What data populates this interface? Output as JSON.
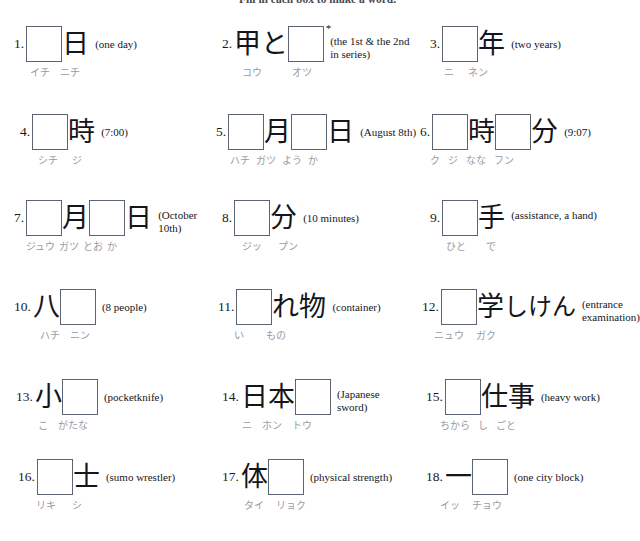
{
  "worksheet": {
    "instruction": "Fill in each box to make a word.",
    "exercise_count": 18
  },
  "items": [
    {
      "number": "1.",
      "gloss": "(one day)",
      "gloss_lines": 1,
      "asterisk": "",
      "glyphs": [
        {
          "type": "box",
          "text": ""
        },
        {
          "type": "kanji",
          "text": "日"
        }
      ],
      "readings": [
        "イチ",
        "ニチ"
      ]
    },
    {
      "number": "2.",
      "gloss": "(the 1st & the 2nd in series)",
      "gloss_lines": 2,
      "asterisk": "*",
      "glyphs": [
        {
          "type": "kanji",
          "text": "甲"
        },
        {
          "type": "kanji",
          "text": "と"
        },
        {
          "type": "box",
          "text": ""
        }
      ],
      "readings": [
        "コウ",
        "オツ"
      ]
    },
    {
      "number": "3.",
      "gloss": "(two years)",
      "gloss_lines": 1,
      "asterisk": "",
      "glyphs": [
        {
          "type": "box",
          "text": ""
        },
        {
          "type": "kanji",
          "text": "年"
        }
      ],
      "readings": [
        "ニ",
        "ネン"
      ]
    },
    {
      "number": "4.",
      "gloss": "(7:00)",
      "gloss_lines": 1,
      "asterisk": "",
      "glyphs": [
        {
          "type": "box",
          "text": ""
        },
        {
          "type": "kanji",
          "text": "時"
        }
      ],
      "readings": [
        "シチ",
        "ジ"
      ]
    },
    {
      "number": "5.",
      "gloss": "(August 8th)",
      "gloss_lines": 1,
      "asterisk": "",
      "glyphs": [
        {
          "type": "box",
          "text": ""
        },
        {
          "type": "kanji",
          "text": "月"
        },
        {
          "type": "box",
          "text": ""
        },
        {
          "type": "kanji",
          "text": "日"
        }
      ],
      "readings": [
        "ハチ",
        "ガツ",
        "よう",
        "か"
      ]
    },
    {
      "number": "6.",
      "gloss": "(9:07)",
      "gloss_lines": 1,
      "asterisk": "",
      "glyphs": [
        {
          "type": "box",
          "text": ""
        },
        {
          "type": "kanji",
          "text": "時"
        },
        {
          "type": "box",
          "text": ""
        },
        {
          "type": "kanji",
          "text": "分"
        }
      ],
      "readings": [
        "ク",
        "ジ",
        "なな",
        "フン"
      ]
    },
    {
      "number": "7.",
      "gloss": "(October 10th)",
      "gloss_lines": 2,
      "asterisk": "",
      "glyphs": [
        {
          "type": "box",
          "text": ""
        },
        {
          "type": "kanji",
          "text": "月"
        },
        {
          "type": "box",
          "text": ""
        },
        {
          "type": "kanji",
          "text": "日"
        }
      ],
      "readings": [
        "ジュウ",
        "ガツ",
        "とお",
        "か"
      ]
    },
    {
      "number": "8.",
      "gloss": "(10 minutes)",
      "gloss_lines": 1,
      "asterisk": "",
      "glyphs": [
        {
          "type": "box",
          "text": ""
        },
        {
          "type": "kanji",
          "text": "分"
        }
      ],
      "readings": [
        "ジッ",
        "プン"
      ]
    },
    {
      "number": "9.",
      "gloss": "(assistance, a hand)",
      "gloss_lines": 2,
      "asterisk": "",
      "glyphs": [
        {
          "type": "box",
          "text": ""
        },
        {
          "type": "kanji",
          "text": "手"
        }
      ],
      "readings": [
        "ひと",
        "で"
      ]
    },
    {
      "number": "10.",
      "gloss": "(8 people)",
      "gloss_lines": 1,
      "asterisk": "",
      "glyphs": [
        {
          "type": "kanji",
          "text": "八"
        },
        {
          "type": "box",
          "text": ""
        }
      ],
      "readings": [
        "ハチ",
        "ニン"
      ]
    },
    {
      "number": "11.",
      "gloss": "(container)",
      "gloss_lines": 1,
      "asterisk": "",
      "glyphs": [
        {
          "type": "box",
          "text": ""
        },
        {
          "type": "kanji",
          "text": "れ"
        },
        {
          "type": "kanji",
          "text": "物"
        }
      ],
      "readings": [
        "い",
        "もの"
      ]
    },
    {
      "number": "12.",
      "gloss": "(entrance examination)",
      "gloss_lines": 2,
      "asterisk": "",
      "glyphs": [
        {
          "type": "box",
          "text": ""
        },
        {
          "type": "kanji",
          "text": "学"
        },
        {
          "type": "kanji",
          "text": "しけん"
        }
      ],
      "readings": [
        "ニュウ",
        "ガク"
      ]
    },
    {
      "number": "13.",
      "gloss": "(pocketknife)",
      "gloss_lines": 1,
      "asterisk": "",
      "glyphs": [
        {
          "type": "kanji",
          "text": "小"
        },
        {
          "type": "box",
          "text": ""
        }
      ],
      "readings": [
        "こ",
        "がたな"
      ]
    },
    {
      "number": "14.",
      "gloss": "(Japanese sword)",
      "gloss_lines": 2,
      "asterisk": "",
      "glyphs": [
        {
          "type": "kanji",
          "text": "日"
        },
        {
          "type": "kanji",
          "text": "本"
        },
        {
          "type": "box",
          "text": ""
        }
      ],
      "readings": [
        "ニ",
        "ホン",
        "トウ"
      ]
    },
    {
      "number": "15.",
      "gloss": "(heavy work)",
      "gloss_lines": 1,
      "asterisk": "",
      "glyphs": [
        {
          "type": "box",
          "text": ""
        },
        {
          "type": "kanji",
          "text": "仕"
        },
        {
          "type": "kanji",
          "text": "事"
        }
      ],
      "readings": [
        "ちから",
        "し",
        "ごと"
      ]
    },
    {
      "number": "16.",
      "gloss": "(sumo wrestler)",
      "gloss_lines": 1,
      "asterisk": "",
      "glyphs": [
        {
          "type": "box",
          "text": ""
        },
        {
          "type": "kanji",
          "text": "士"
        }
      ],
      "readings": [
        "リキ",
        "シ"
      ]
    },
    {
      "number": "17.",
      "gloss": "(physical strength)",
      "gloss_lines": 1,
      "asterisk": "",
      "glyphs": [
        {
          "type": "kanji",
          "text": "体"
        },
        {
          "type": "box",
          "text": ""
        }
      ],
      "readings": [
        "タイ",
        "リョク"
      ]
    },
    {
      "number": "18.",
      "gloss": "(one city block)",
      "gloss_lines": 1,
      "asterisk": "",
      "glyphs": [
        {
          "type": "kanji",
          "text": "一"
        },
        {
          "type": "box",
          "text": ""
        }
      ],
      "readings": [
        "イッ",
        "チョウ"
      ]
    }
  ]
}
